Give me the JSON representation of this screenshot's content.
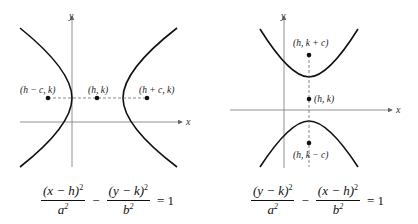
{
  "figures": [
    {
      "id": "horizontal-transverse",
      "axis_labels": {
        "x": "x",
        "y": "y"
      },
      "points": [
        {
          "label": "(h − c, k)",
          "role": "focus-left"
        },
        {
          "label": "(h, k)",
          "role": "center"
        },
        {
          "label": "(h + c, k)",
          "role": "focus-right"
        }
      ],
      "equation": {
        "term1_num": "(x − h)",
        "term1_den": "a",
        "operator": "−",
        "term2_num": "(y − k)",
        "term2_den": "b",
        "exponent": "2",
        "equals": "= 1"
      }
    },
    {
      "id": "vertical-transverse",
      "axis_labels": {
        "x": "x",
        "y": "y"
      },
      "points": [
        {
          "label": "(h, k + c)",
          "role": "focus-top"
        },
        {
          "label": "(h, k)",
          "role": "center"
        },
        {
          "label": "(h, k − c)",
          "role": "focus-bottom"
        }
      ],
      "equation": {
        "term1_num": "(y − k)",
        "term1_den": "a",
        "operator": "−",
        "term2_num": "(x − h)",
        "term2_den": "b",
        "exponent": "2",
        "equals": "= 1"
      }
    }
  ]
}
